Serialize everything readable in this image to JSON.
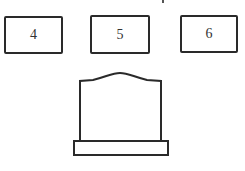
{
  "figure": {
    "boxes": [
      {
        "label": "4"
      },
      {
        "label": "5"
      },
      {
        "label": "6"
      }
    ],
    "tombstone": {
      "shape": "tombstone-with-base"
    },
    "colors": {
      "stroke": "#2a2a2a",
      "background": "#ffffff"
    }
  }
}
